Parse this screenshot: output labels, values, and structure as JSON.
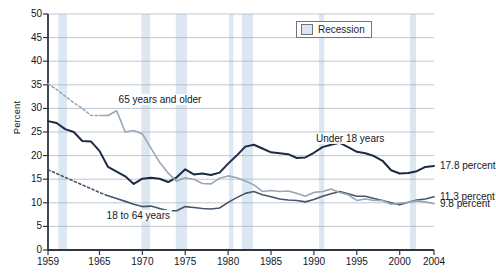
{
  "chart_data": {
    "type": "line",
    "title": "",
    "xlabel": "",
    "ylabel": "Percent",
    "xlim": [
      1959,
      2004
    ],
    "ylim": [
      0,
      50
    ],
    "ytick_values": [
      0,
      5,
      10,
      15,
      20,
      25,
      30,
      35,
      40,
      45,
      50
    ],
    "xtick_values": [
      1959,
      1965,
      1970,
      1975,
      1980,
      1985,
      1990,
      1995,
      2000,
      2004
    ],
    "grid": true,
    "legend_position": "top-right",
    "legend": [
      {
        "label": "Recession",
        "type": "band",
        "color": "#dce6f0"
      }
    ],
    "annotations": [
      {
        "text": "65 years and older",
        "x": 1967.0,
        "y": 31.8
      },
      {
        "text": "Under 18 years",
        "x": 1990.0,
        "y": 23.5
      },
      {
        "text": "18 to 64 years",
        "x": 1965.6,
        "y": 7.3
      }
    ],
    "end_labels": [
      {
        "text": "17.8 percent",
        "series": "Under 18 years",
        "value": 17.8
      },
      {
        "text": "11.3 percent",
        "series": "18 to 64 years",
        "value": 11.3
      },
      {
        "text": "9.8 percent",
        "series": "65 years and older",
        "value": 9.8
      }
    ],
    "recession_bands": [
      {
        "start": 1960.2,
        "end": 1961.2
      },
      {
        "start": 1969.9,
        "end": 1970.9
      },
      {
        "start": 1973.9,
        "end": 1975.2
      },
      {
        "start": 1980.1,
        "end": 1980.6
      },
      {
        "start": 1981.6,
        "end": 1982.9
      },
      {
        "start": 1990.6,
        "end": 1991.2
      },
      {
        "start": 2001.2,
        "end": 2001.9
      }
    ],
    "series": [
      {
        "name": "Under 18 years",
        "color": "#1c2b43",
        "width": 2.0,
        "dashed_segment": false,
        "x": [
          1959,
          1960,
          1961,
          1962,
          1963,
          1964,
          1965,
          1966,
          1967,
          1968,
          1969,
          1970,
          1971,
          1972,
          1973,
          1974,
          1975,
          1976,
          1977,
          1978,
          1979,
          1980,
          1981,
          1982,
          1983,
          1984,
          1985,
          1986,
          1987,
          1988,
          1989,
          1990,
          1991,
          1992,
          1993,
          1994,
          1995,
          1996,
          1997,
          1998,
          1999,
          2000,
          2001,
          2002,
          2003,
          2004
        ],
        "values": [
          27.3,
          26.9,
          25.6,
          25.0,
          23.1,
          23.0,
          21.0,
          17.6,
          16.6,
          15.6,
          14.0,
          15.1,
          15.3,
          15.1,
          14.4,
          15.4,
          17.1,
          16.0,
          16.2,
          15.9,
          16.4,
          18.3,
          20.0,
          21.9,
          22.3,
          21.5,
          20.7,
          20.5,
          20.3,
          19.5,
          19.6,
          20.6,
          21.8,
          22.3,
          22.7,
          21.8,
          20.8,
          20.5,
          19.9,
          18.9,
          16.9,
          16.2,
          16.3,
          16.7,
          17.6,
          17.8
        ]
      },
      {
        "name": "18 to 64 years",
        "color": "#46556b",
        "width": 1.6,
        "dashed_segment": true,
        "dashed_through": 1966,
        "x": [
          1959,
          1960,
          1961,
          1962,
          1963,
          1964,
          1965,
          1966,
          1967,
          1968,
          1969,
          1970,
          1971,
          1972,
          1973,
          1974,
          1975,
          1976,
          1977,
          1978,
          1979,
          1980,
          1981,
          1982,
          1983,
          1984,
          1985,
          1986,
          1987,
          1988,
          1989,
          1990,
          1991,
          1992,
          1993,
          1994,
          1995,
          1996,
          1997,
          1998,
          1999,
          2000,
          2001,
          2002,
          2003,
          2004
        ],
        "values": [
          17.0,
          16.2,
          15.4,
          14.6,
          13.8,
          13.0,
          12.2,
          11.5,
          10.9,
          10.3,
          9.7,
          9.2,
          9.3,
          8.8,
          8.3,
          8.3,
          9.2,
          9.0,
          8.8,
          8.7,
          8.9,
          10.1,
          11.1,
          12.0,
          12.4,
          11.7,
          11.3,
          10.8,
          10.6,
          10.5,
          10.2,
          10.7,
          11.4,
          11.9,
          12.4,
          11.9,
          11.4,
          11.4,
          10.9,
          10.5,
          10.0,
          9.6,
          10.1,
          10.6,
          10.8,
          11.3
        ]
      },
      {
        "name": "65 years and older",
        "color": "#98a6b5",
        "width": 1.6,
        "dashed_segment": true,
        "dashed_through": 1965,
        "x": [
          1959,
          1960,
          1961,
          1962,
          1963,
          1964,
          1965,
          1966,
          1967,
          1968,
          1969,
          1970,
          1971,
          1972,
          1973,
          1974,
          1975,
          1976,
          1977,
          1978,
          1979,
          1980,
          1981,
          1982,
          1983,
          1984,
          1985,
          1986,
          1987,
          1988,
          1989,
          1990,
          1991,
          1992,
          1993,
          1994,
          1995,
          1996,
          1997,
          1998,
          1999,
          2000,
          2001,
          2002,
          2003,
          2004
        ],
        "values": [
          35.2,
          34.0,
          32.6,
          31.2,
          30.0,
          28.5,
          28.5,
          28.5,
          29.5,
          25.0,
          25.3,
          24.6,
          21.6,
          18.6,
          16.3,
          14.6,
          15.3,
          15.0,
          14.1,
          14.0,
          15.2,
          15.7,
          15.3,
          14.6,
          13.8,
          12.4,
          12.6,
          12.4,
          12.5,
          12.0,
          11.4,
          12.2,
          12.4,
          12.9,
          12.2,
          11.7,
          10.5,
          10.8,
          10.5,
          10.5,
          9.7,
          9.9,
          10.1,
          10.4,
          10.2,
          9.8
        ]
      }
    ]
  },
  "axis": {
    "ylabel": "Percent",
    "yticks": [
      "50",
      "45",
      "40",
      "35",
      "30",
      "25",
      "20",
      "15",
      "10",
      "5",
      "0"
    ],
    "xticks": [
      "1959",
      "1965",
      "1970",
      "1975",
      "1980",
      "1985",
      "1990",
      "1995",
      "2000",
      "2004"
    ]
  },
  "legend": {
    "recession_label": "Recession"
  },
  "labels": {
    "older": "65 years and older",
    "under18": "Under 18 years",
    "adults": "18 to 64 years",
    "end_under18": "17.8 percent",
    "end_adults": "11.3 percent",
    "end_older": "9.8 percent"
  }
}
